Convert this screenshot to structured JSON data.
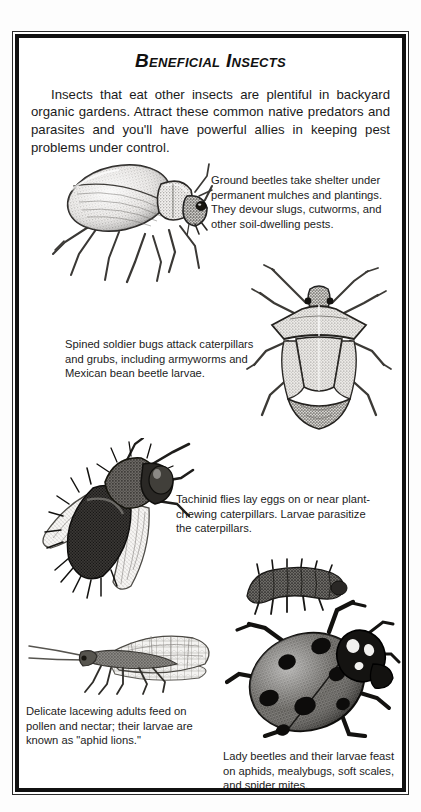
{
  "page": {
    "title": "Beneficial Insects",
    "intro": "Insects that eat other insects are plentiful in backyard organic gardens. Attract these common native predators and parasites and you'll have powerful allies in keeping pest problems under control.",
    "background_color": "#fdfdfd",
    "frame_color": "#111111",
    "text_color": "#1a1a1a"
  },
  "captions": {
    "ground_beetle": "Ground beetles take shelter under permanent mulches and plantings. They devour slugs, cutworms, and other soil-dwelling pests.",
    "spined_soldier_bug": "Spined soldier bugs attack caterpillars and grubs, including armyworms and Mexican bean beetle larvae.",
    "tachinid_fly": "Tachinid flies lay eggs on or near plant-chewing caterpillars. Larvae parasitize the caterpillars.",
    "lacewing": "Delicate lacewing adults feed on pollen and nectar; their larvae are known as \"aphid lions.\"",
    "lady_beetle": "Lady beetles and their larvae feast on aphids, mealybugs, soft scales, and spider mites."
  },
  "illustrations": {
    "ground_beetle": "ground-beetle-illustration",
    "spined_soldier_bug": "spined-soldier-bug-illustration",
    "tachinid_fly": "tachinid-fly-illustration",
    "lacewing": "lacewing-illustration",
    "lady_beetle": "lady-beetle-illustration",
    "lady_beetle_larva": "lady-beetle-larva-illustration"
  }
}
